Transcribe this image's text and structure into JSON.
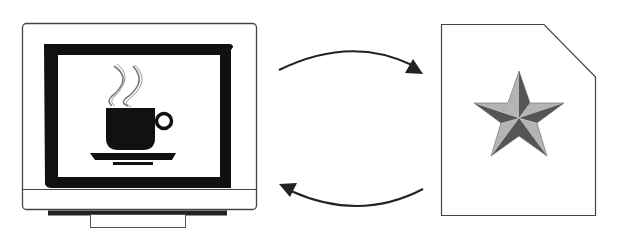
{
  "diagram": {
    "left_node": {
      "label": "",
      "type": "computer-monitor",
      "screen_content": "coffee-cup-icon"
    },
    "right_node": {
      "label": "",
      "type": "document",
      "content": "star-icon"
    },
    "edges": [
      {
        "from": "left_node",
        "to": "right_node",
        "direction": "right",
        "shape": "curved-arc-top"
      },
      {
        "from": "right_node",
        "to": "left_node",
        "direction": "left",
        "shape": "curved-arc-bottom"
      }
    ]
  },
  "colors": {
    "stroke": "#222222",
    "frame": "#111111",
    "outline": "#555555",
    "star_light": "#a8a8a8",
    "star_dark": "#555555",
    "background": "#ffffff"
  }
}
